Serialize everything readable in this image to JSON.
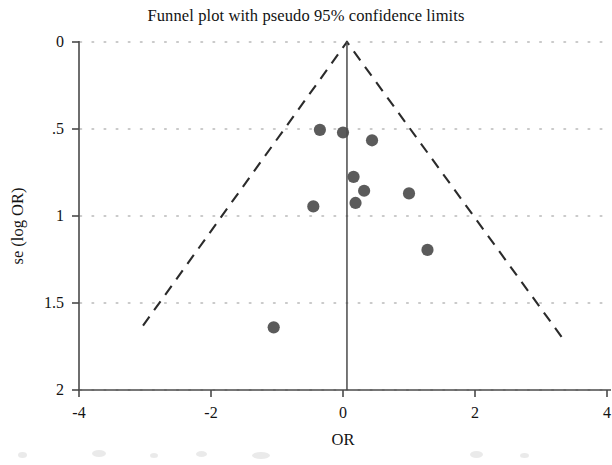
{
  "chart_data": {
    "type": "scatter",
    "title": "Funnel plot with pseudo 95% confidence limits",
    "xlabel": "OR",
    "ylabel": "se (log OR)",
    "xlim": [
      -4,
      4
    ],
    "ylim": [
      2,
      0
    ],
    "y_axis_inverted": true,
    "grid": "horizontal-dotted",
    "xticks": [
      -4,
      -2,
      0,
      2,
      4
    ],
    "xtick_labels": [
      "-4",
      "-2",
      "0",
      "2",
      "4"
    ],
    "yticks": [
      0,
      0.5,
      1,
      1.5,
      2
    ],
    "ytick_labels": [
      "0",
      ".5",
      "1",
      "1.5",
      "2"
    ],
    "legend": null,
    "series": [
      {
        "name": "studies",
        "marker": "filled-circle",
        "color": "#4d4d4d",
        "points": [
          {
            "x": -0.35,
            "y": 0.505
          },
          {
            "x": 0.0,
            "y": 0.52
          },
          {
            "x": 0.44,
            "y": 0.565
          },
          {
            "x": -0.45,
            "y": 0.945
          },
          {
            "x": 0.16,
            "y": 0.775
          },
          {
            "x": 0.32,
            "y": 0.855
          },
          {
            "x": 0.19,
            "y": 0.925
          },
          {
            "x": 1.0,
            "y": 0.87
          },
          {
            "x": 1.28,
            "y": 1.195
          },
          {
            "x": -1.05,
            "y": 1.64
          }
        ]
      }
    ],
    "reference_line": {
      "name": "pooled-effect-line",
      "orientation": "vertical",
      "x": 0.06,
      "style": "solid",
      "color": "#555555"
    },
    "confidence_limits": {
      "name": "pseudo-95-confidence-limits",
      "style": "dashed",
      "color": "#2b2b2b",
      "apex": {
        "x": 0.06,
        "y": 0.0
      },
      "left_end": {
        "x": -3.03,
        "y": 1.63
      },
      "right_end": {
        "x": 3.36,
        "y": 1.72
      }
    }
  },
  "axes": {
    "x_title": "OR",
    "y_title": "se (log OR)",
    "x_tick_labels": [
      "-4",
      "-2",
      "0",
      "2",
      "4"
    ],
    "y_tick_labels": [
      "0",
      ".5",
      "1",
      "1.5",
      "2"
    ]
  },
  "colors": {
    "marker": "#4d4d4d",
    "axis": "#4a4a4a",
    "grid_dot": "#b9b9b9",
    "dash": "#2b2b2b",
    "text": "#131313",
    "background": "#ffffff"
  }
}
